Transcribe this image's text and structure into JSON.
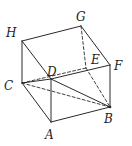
{
  "figure": {
    "vertices": {
      "A": {
        "x": 51,
        "y": 122,
        "lx": 45,
        "ly": 139
      },
      "B": {
        "x": 110,
        "y": 107,
        "lx": 104,
        "ly": 123
      },
      "C": {
        "x": 22,
        "y": 83,
        "lx": 4,
        "ly": 90
      },
      "D": {
        "x": 51,
        "y": 79,
        "lx": 47,
        "ly": 76
      },
      "E": {
        "x": 86,
        "y": 68,
        "lx": 91,
        "ly": 64
      },
      "F": {
        "x": 110,
        "y": 65,
        "lx": 114,
        "ly": 70
      },
      "G": {
        "x": 81,
        "y": 26,
        "lx": 76,
        "ly": 21
      },
      "H": {
        "x": 22,
        "y": 41,
        "lx": 6,
        "ly": 37
      }
    },
    "labels": [
      "A",
      "B",
      "C",
      "D",
      "E",
      "F",
      "G",
      "H"
    ],
    "edges": [
      {
        "from": "H",
        "to": "G",
        "style": "solid"
      },
      {
        "from": "G",
        "to": "F",
        "style": "solid"
      },
      {
        "from": "H",
        "to": "C",
        "style": "solid"
      },
      {
        "from": "H",
        "to": "D",
        "style": "solid"
      },
      {
        "from": "D",
        "to": "F",
        "style": "solid"
      },
      {
        "from": "C",
        "to": "D",
        "style": "solid"
      },
      {
        "from": "C",
        "to": "A",
        "style": "solid"
      },
      {
        "from": "D",
        "to": "A",
        "style": "solid"
      },
      {
        "from": "A",
        "to": "B",
        "style": "solid"
      },
      {
        "from": "F",
        "to": "B",
        "style": "solid"
      },
      {
        "from": "D",
        "to": "B",
        "style": "solid"
      },
      {
        "from": "C",
        "to": "B",
        "style": "dashed"
      },
      {
        "from": "C",
        "to": "E",
        "style": "dashed"
      },
      {
        "from": "G",
        "to": "E",
        "style": "dashed"
      },
      {
        "from": "E",
        "to": "B",
        "style": "dashed"
      }
    ],
    "colors": {
      "stroke": "#2a2a2a",
      "label": "#1e1e1e",
      "background": "#ffffff"
    }
  }
}
